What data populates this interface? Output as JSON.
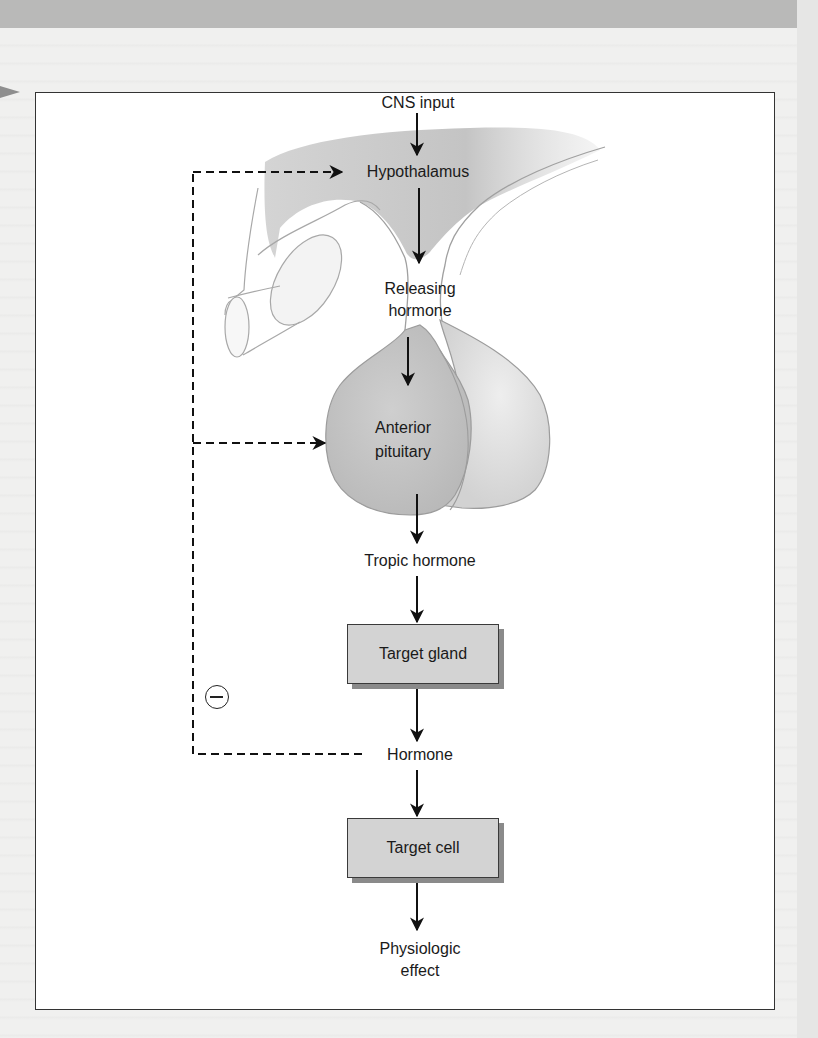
{
  "page": {
    "background": "#f0f0ef",
    "top_band_color": "#b9b9b8"
  },
  "figure": {
    "nodes": {
      "cns_input": "CNS input",
      "hypothalamus": "Hypothalamus",
      "releasing_hormone_line1": "Releasing",
      "releasing_hormone_line2": "hormone",
      "anterior_pituitary_line1": "Anterior",
      "anterior_pituitary_line2": "pituitary",
      "tropic_hormone": "Tropic hormone",
      "target_gland": "Target gland",
      "hormone": "Hormone",
      "target_cell": "Target cell",
      "physiologic_effect_line1": "Physiologic",
      "physiologic_effect_line2": "effect"
    },
    "feedback": {
      "symbol": "minus",
      "type": "negative feedback",
      "targets": [
        "Hypothalamus",
        "Anterior pituitary"
      ],
      "source": "Hormone"
    },
    "colors": {
      "box_fill": "#d3d3d3",
      "box_shadow": "#8a8a8a",
      "anatomy_fill": "#c9c9c9",
      "arrow": "#111111"
    }
  }
}
